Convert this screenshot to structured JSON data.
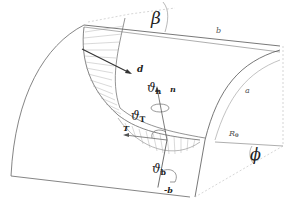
{
  "figure": {
    "type": "3d-geometry-diagram",
    "colors": {
      "line": "#555555",
      "hatch": "#9a9a9a",
      "dashed": "#bbbbbb",
      "vector": "#333333"
    }
  },
  "labels": {
    "beta": "β",
    "b_length": "b",
    "a_radius": "a",
    "d_vector": "d",
    "n_vector": "n",
    "T_vector": "T",
    "minus_b_vector": "-b",
    "theta": "ϑ",
    "theta_n_sub": "n",
    "theta_T_sub": "T",
    "theta_b_sub": "b",
    "R0": "R",
    "R0_sub": "0",
    "phi": "ϕ"
  }
}
